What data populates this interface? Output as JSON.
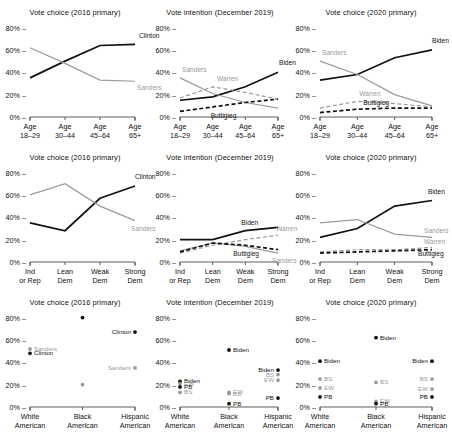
{
  "figure": {
    "columns": [
      "Vote choice (2016 primary)",
      "Vote intention (December 2019)",
      "Vote choice (2020 primary)"
    ],
    "y_ticks": [
      "0%",
      "20%",
      "40%",
      "60%",
      "80%"
    ],
    "colors": {
      "dark": "#111111",
      "gray": "#9a9a9a",
      "axis": "#4d4d4d"
    }
  },
  "chart_data": [
    {
      "type": "line",
      "title": "Vote choice (2016 primary)",
      "xlabel": "",
      "ylabel": "",
      "ylim": [
        0,
        85
      ],
      "grid": false,
      "legend": "inline-end-of-line",
      "categories": [
        "Age\n18–29",
        "Age\n30–44",
        "Age\n45–64",
        "Age\n65+"
      ],
      "series": [
        {
          "name": "Clinton",
          "style": "solid",
          "color": "#111111",
          "values": [
            35,
            50,
            64,
            65
          ]
        },
        {
          "name": "Sanders",
          "style": "solid",
          "color": "#9a9a9a",
          "values": [
            62,
            48,
            33,
            32
          ]
        }
      ]
    },
    {
      "type": "line",
      "title": "Vote intention (December 2019)",
      "xlabel": "",
      "ylabel": "",
      "ylim": [
        0,
        85
      ],
      "grid": false,
      "legend": "inline",
      "categories": [
        "Age\n18–29",
        "Age\n30–44",
        "Age\n45–64",
        "Age\n65+"
      ],
      "series": [
        {
          "name": "Biden",
          "style": "solid",
          "color": "#111111",
          "values": [
            15,
            18,
            27,
            40
          ]
        },
        {
          "name": "Sanders",
          "style": "solid",
          "color": "#9a9a9a",
          "values": [
            35,
            21,
            13,
            8
          ]
        },
        {
          "name": "Warren",
          "style": "dashed",
          "color": "#9a9a9a",
          "values": [
            17,
            27,
            22,
            16
          ]
        },
        {
          "name": "Buttigieg",
          "style": "dashed",
          "color": "#111111",
          "values": [
            5,
            9,
            13,
            16
          ]
        }
      ]
    },
    {
      "type": "line",
      "title": "Vote choice (2020 primary)",
      "xlabel": "",
      "ylabel": "",
      "ylim": [
        0,
        85
      ],
      "grid": false,
      "legend": "inline",
      "categories": [
        "Age\n18–29",
        "Age\n30–44",
        "Age\n45–64",
        "Age\n65+"
      ],
      "series": [
        {
          "name": "Biden",
          "style": "solid",
          "color": "#111111",
          "values": [
            33,
            38,
            53,
            60
          ]
        },
        {
          "name": "Sanders",
          "style": "solid",
          "color": "#9a9a9a",
          "values": [
            50,
            38,
            20,
            10
          ]
        },
        {
          "name": "Warren",
          "style": "dashed",
          "color": "#9a9a9a",
          "values": [
            8,
            14,
            12,
            9
          ]
        },
        {
          "name": "Buttigieg",
          "style": "dashed",
          "color": "#111111",
          "values": [
            4,
            7,
            8,
            8
          ]
        }
      ]
    },
    {
      "type": "line",
      "title": "Vote choice (2016 primary)",
      "xlabel": "",
      "ylabel": "",
      "ylim": [
        0,
        85
      ],
      "grid": false,
      "legend": "inline",
      "categories": [
        "Ind\nor Rep",
        "Lean\nDem",
        "Weak\nDem",
        "Strong\nDem"
      ],
      "series": [
        {
          "name": "Clinton",
          "style": "solid",
          "color": "#111111",
          "values": [
            35,
            28,
            57,
            68
          ]
        },
        {
          "name": "Sanders",
          "style": "solid",
          "color": "#9a9a9a",
          "values": [
            60,
            70,
            50,
            37
          ]
        }
      ]
    },
    {
      "type": "line",
      "title": "Vote intention (December 2019)",
      "xlabel": "",
      "ylabel": "",
      "ylim": [
        0,
        85
      ],
      "grid": false,
      "legend": "inline",
      "categories": [
        "Ind\nor Rep",
        "Lean\nDem",
        "Weak\nDem",
        "Strong\nDem"
      ],
      "series": [
        {
          "name": "Biden",
          "style": "solid",
          "color": "#111111",
          "values": [
            20,
            20,
            28,
            31
          ]
        },
        {
          "name": "Sanders",
          "style": "solid",
          "color": "#9a9a9a",
          "values": [
            10,
            17,
            14,
            8
          ]
        },
        {
          "name": "Warren",
          "style": "dashed",
          "color": "#9a9a9a",
          "values": [
            8,
            15,
            20,
            24
          ]
        },
        {
          "name": "Buttigieg",
          "style": "dashed",
          "color": "#111111",
          "values": [
            9,
            17,
            15,
            11
          ]
        }
      ]
    },
    {
      "type": "line",
      "title": "Vote choice (2020 primary)",
      "xlabel": "",
      "ylabel": "",
      "ylim": [
        0,
        85
      ],
      "grid": false,
      "legend": "inline",
      "categories": [
        "Ind\nor Rep",
        "Lean\nDem",
        "Weak\nDem",
        "Strong\nDem"
      ],
      "series": [
        {
          "name": "Biden",
          "style": "solid",
          "color": "#111111",
          "values": [
            22,
            30,
            50,
            55
          ]
        },
        {
          "name": "Sanders",
          "style": "solid",
          "color": "#9a9a9a",
          "values": [
            35,
            38,
            25,
            22
          ]
        },
        {
          "name": "Warren",
          "style": "dashed",
          "color": "#9a9a9a",
          "values": [
            9,
            11,
            11,
            13
          ]
        },
        {
          "name": "Buttigieg",
          "style": "dashed",
          "color": "#111111",
          "values": [
            8,
            9,
            10,
            11
          ]
        }
      ]
    },
    {
      "type": "scatter",
      "title": "Vote choice (2016 primary)",
      "xlabel": "",
      "ylabel": "",
      "ylim": [
        0,
        85
      ],
      "grid": false,
      "categories": [
        "White\nAmerican",
        "Black\nAmerican",
        "Hispanic\nAmerican"
      ],
      "series": [
        {
          "name": "Clinton",
          "short": "Clinton",
          "color": "#111111",
          "values": [
            48,
            80,
            67
          ]
        },
        {
          "name": "Sanders",
          "short": "Sanders",
          "color": "#9a9a9a",
          "values": [
            52,
            20,
            35
          ]
        }
      ]
    },
    {
      "type": "scatter",
      "title": "Vote intention (December 2019)",
      "xlabel": "",
      "ylabel": "",
      "ylim": [
        0,
        85
      ],
      "grid": false,
      "categories": [
        "White\nAmerican",
        "Black\nAmerican",
        "Hispanic\nAmerican"
      ],
      "series": [
        {
          "name": "Biden",
          "short": "Biden",
          "color": "#111111",
          "values": [
            23,
            51,
            33
          ]
        },
        {
          "name": "Elizabeth Warren",
          "short": "EW",
          "color": "#9a9a9a",
          "values": [
            21,
            13,
            24
          ]
        },
        {
          "name": "Bernie Sanders",
          "short": "BS",
          "color": "#9a9a9a",
          "values": [
            13,
            12,
            29
          ]
        },
        {
          "name": "Pete Buttigieg",
          "short": "PB",
          "color": "#111111",
          "values": [
            18,
            3,
            8
          ]
        }
      ]
    },
    {
      "type": "scatter",
      "title": "Vote choice (2020 primary)",
      "xlabel": "",
      "ylabel": "",
      "ylim": [
        0,
        85
      ],
      "grid": false,
      "categories": [
        "White\nAmerican",
        "Black\nAmerican",
        "Hispanic\nAmerican"
      ],
      "series": [
        {
          "name": "Biden",
          "short": "Biden",
          "color": "#111111",
          "values": [
            41,
            62,
            41
          ]
        },
        {
          "name": "Bernie Sanders",
          "short": "BS",
          "color": "#9a9a9a",
          "values": [
            25,
            22,
            25
          ]
        },
        {
          "name": "Elizabeth Warren",
          "short": "EW",
          "color": "#9a9a9a",
          "values": [
            17,
            5,
            16
          ]
        },
        {
          "name": "Pete Buttigieg",
          "short": "PB",
          "color": "#111111",
          "values": [
            9,
            3,
            9
          ]
        }
      ]
    }
  ]
}
